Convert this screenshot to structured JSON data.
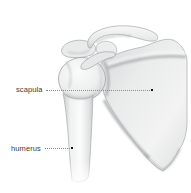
{
  "figure": {
    "background_color": "#ffffff"
  },
  "labels": [
    {
      "text": "scapula",
      "points_to": "scapula bone body",
      "leader_style": "dotted",
      "endpoint": "small black square dot"
    },
    {
      "text": "humerus",
      "points_to": "humerus shaft",
      "leader_style": "dotted",
      "endpoint": "small black square dot"
    }
  ],
  "colors": {
    "label_text": "#3c3c3c",
    "leader_line": "#8f8f8f",
    "leader_endpoint": "#141414",
    "bone_highlight": "#fafafa",
    "bone_mid": "#e9eaea",
    "bone_shadow": "#c6c9cb",
    "bone_outline": "#a0a3a5"
  }
}
